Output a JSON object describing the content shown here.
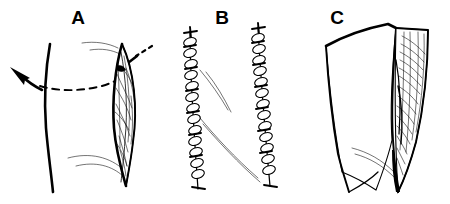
{
  "figure": {
    "background_color": "#ffffff",
    "ink_color": "#000000",
    "width": 450,
    "height": 204,
    "panel_count": 3
  },
  "panels": [
    {
      "id": "a",
      "label": "A",
      "label_x": 78,
      "label_y": 24,
      "description": "Body contour with dashed incision guide line, curved arrow directed left and a straight arrow with dashed tail pointing into an open lens-shaped wound showing exposed fibrous tissue",
      "elements": {
        "body_contour": "skin-contour-line",
        "guide": "dashed-incision-line",
        "retraction_arrow": "curved-arrow-left",
        "pointer_arrow": "straight-arrow-into-wound",
        "wound": "open-elliptical-wound",
        "wound_interior": "exposed-muscle-fibers",
        "creases": "skin-crease-lines"
      }
    },
    {
      "id": "b",
      "label": "B",
      "label_x": 222,
      "label_y": 24,
      "description": "Two parallel vertical running suture lines with looped stitches and terminal knots, thin skin crease lines crossing between them",
      "elements": {
        "left_suture": "running-suture-line-left",
        "right_suture": "running-suture-line-right",
        "creases": "skin-crease-lines"
      }
    },
    {
      "id": "c",
      "label": "C",
      "label_x": 337,
      "label_y": 24,
      "description": "Retracted skin flap with thick border folded back to expose a wedge-shaped field of hatched fibrous tissue",
      "elements": {
        "flap": "retracted-skin-flap",
        "flap_edge": "flap-cut-edge",
        "exposed_field": "exposed-tissue-wedge",
        "hatching": "tissue-hatching",
        "creases": "skin-crease-lines"
      }
    }
  ]
}
